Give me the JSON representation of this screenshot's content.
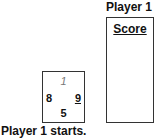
{
  "player": {
    "label": "Player 1"
  },
  "score_box": {
    "title": "Score"
  },
  "card": {
    "top": "1",
    "left": "8",
    "right": "9",
    "bottom": "5"
  },
  "status": {
    "text": "Player 1 starts."
  }
}
